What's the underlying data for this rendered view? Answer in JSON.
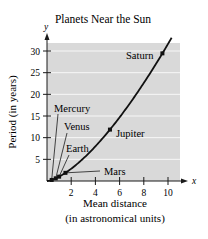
{
  "chart_data": {
    "type": "line",
    "title": "Planets Near the Sun",
    "xlabel": "Mean distance\n(in astronomical units)",
    "xlabel_lines": [
      "Mean distance",
      "(in astronomical units)"
    ],
    "ylabel": "Period (in years)",
    "x_axis_letter": "x",
    "y_axis_letter": "y",
    "xlim": [
      0,
      10.6
    ],
    "ylim": [
      0,
      32
    ],
    "x_ticks": [
      2,
      4,
      6,
      8,
      10
    ],
    "y_ticks": [
      5,
      10,
      15,
      20,
      25,
      30
    ],
    "grid": "horizontal",
    "background": "#d9d9d9",
    "curve": {
      "equation": "y = x^1.5",
      "x_range": [
        0,
        10.3
      ]
    },
    "points": [
      {
        "name": "Mercury",
        "x": 0.387,
        "y": 0.241
      },
      {
        "name": "Venus",
        "x": 0.723,
        "y": 0.615
      },
      {
        "name": "Earth",
        "x": 1.0,
        "y": 1.0
      },
      {
        "name": "Mars",
        "x": 1.524,
        "y": 1.881
      },
      {
        "name": "Jupiter",
        "x": 5.203,
        "y": 11.862
      },
      {
        "name": "Saturn",
        "x": 9.537,
        "y": 29.457
      }
    ],
    "labels": [
      {
        "text": "Saturn",
        "px": 126,
        "py": 59
      },
      {
        "text": "Jupiter",
        "px": 116,
        "py": 137
      },
      {
        "text": "Mercury",
        "px": 54,
        "py": 112
      },
      {
        "text": "Venus",
        "px": 64,
        "py": 130
      },
      {
        "text": "Earth",
        "px": 66,
        "py": 152
      },
      {
        "text": "Mars",
        "px": 104,
        "py": 175
      }
    ]
  }
}
